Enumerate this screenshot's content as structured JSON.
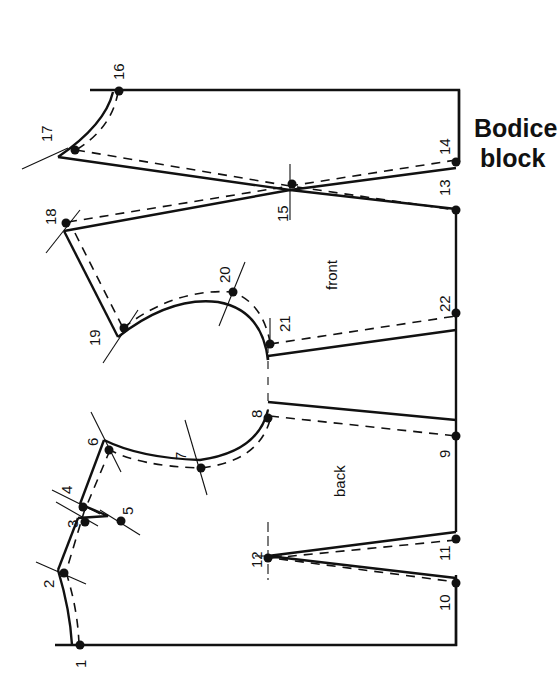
{
  "title": {
    "line1": "Bodice",
    "line2": "block"
  },
  "panels": {
    "front": "front",
    "back": "back"
  },
  "points": {
    "p1": "1",
    "p2": "2",
    "p3": "3",
    "p4": "4",
    "p5": "5",
    "p6": "6",
    "p7": "7",
    "p8": "8",
    "p9": "9",
    "p10": "10",
    "p11": "11",
    "p12": "12",
    "p13": "13",
    "p14": "14",
    "p15": "15",
    "p16": "16",
    "p17": "17",
    "p18": "18",
    "p19": "19",
    "p20": "20",
    "p21": "21",
    "p22": "22"
  },
  "colors": {
    "ink": "#111111",
    "paper": "#ffffff"
  }
}
